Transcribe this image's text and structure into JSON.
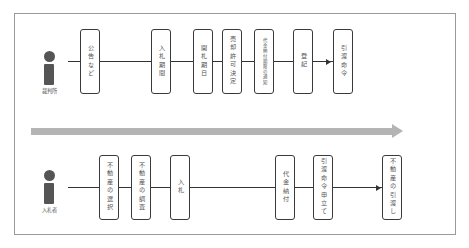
{
  "diagram": {
    "title": "",
    "timeline_arrow": {
      "color": "#b4b4b4",
      "direction": "right"
    },
    "lanes": [
      {
        "actor": "裁判所",
        "steps": [
          {
            "label": "公告など"
          },
          {
            "label": "入札期間"
          },
          {
            "label": "開札期日"
          },
          {
            "label": "売却許可決定"
          },
          {
            "label": "代金納付期限の通知"
          },
          {
            "label": "登記"
          },
          {
            "label": "引渡命令"
          }
        ]
      },
      {
        "actor": "入札者",
        "steps": [
          {
            "label": "不動産の選択"
          },
          {
            "label": "不動産の調査"
          },
          {
            "label": "入札"
          },
          {
            "label": "代金納付"
          },
          {
            "label": "引渡命令申立て"
          },
          {
            "label": "不動産の引渡し"
          }
        ]
      }
    ],
    "colors": {
      "actor_icon": "#555555",
      "box_border": "#3a3a3a",
      "connector": "#333333",
      "frame_border": "#9a9a9a"
    }
  }
}
